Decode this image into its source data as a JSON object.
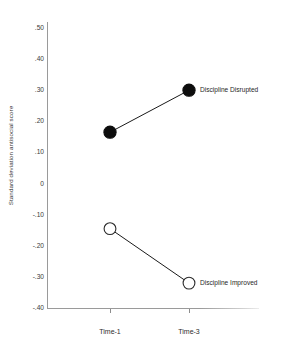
{
  "chart_data": {
    "type": "line",
    "title": "",
    "xlabel": "",
    "ylabel": "Standard deviation antisocial score",
    "categories": [
      "Time-1",
      "Time-3"
    ],
    "ylim": [
      -0.4,
      0.5
    ],
    "ytick_labels": [
      ".50",
      ".40",
      ".30",
      ".20",
      ".10",
      "0",
      "-.10",
      "-.20",
      "-.30",
      "-.40"
    ],
    "ytick_values": [
      0.5,
      0.4,
      0.3,
      0.2,
      0.1,
      0.0,
      -0.1,
      -0.2,
      -0.3,
      -0.4
    ],
    "grid": false,
    "legend_position": "inline-right",
    "series": [
      {
        "name": "Discipline Disrupted",
        "marker": "filled-circle",
        "color": "#0d0d0d",
        "values": [
          0.165,
          0.3
        ]
      },
      {
        "name": "Discipline Improved",
        "marker": "open-circle",
        "color": "#ffffff",
        "values": [
          -0.145,
          -0.32
        ]
      }
    ],
    "annotations": [
      {
        "text": "Discipline Disrupted",
        "series": 0,
        "at_category": "Time-3"
      },
      {
        "text": "Discipline Improved",
        "series": 1,
        "at_category": "Time-3"
      }
    ]
  }
}
